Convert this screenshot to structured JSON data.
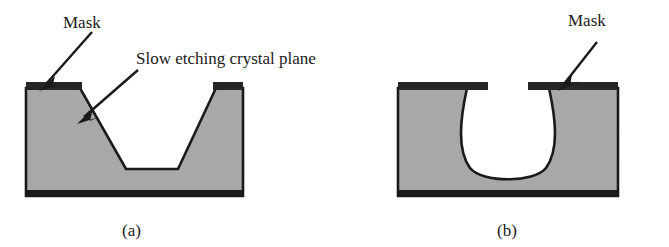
{
  "figure": {
    "annotations": [
      {
        "id": "mask-a",
        "text": "Mask"
      },
      {
        "id": "slow-plane",
        "text": "Slow etching crystal plane"
      },
      {
        "id": "mask-b",
        "text": "Mask"
      }
    ],
    "captions": [
      {
        "id": "a",
        "text": "(a)"
      },
      {
        "id": "b",
        "text": "(b)"
      }
    ],
    "colors": {
      "substrate_fill": "#a8a8a8",
      "outline": "#1a1a1a",
      "mask_fill": "#262626",
      "background": "#ffffff",
      "text": "#1a1a1a"
    },
    "panels": [
      {
        "id": "a",
        "profile_type": "anisotropic-v-groove",
        "description": "Trapezoidal trench with sloped sidewalls bounded by slow etching crystal planes"
      },
      {
        "id": "b",
        "profile_type": "isotropic-undercut",
        "description": "Rounded cavity undercutting the mask edges"
      }
    ]
  }
}
